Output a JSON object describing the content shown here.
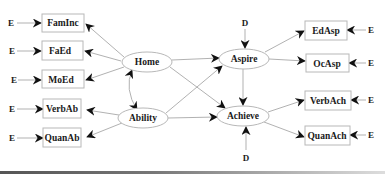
{
  "diagram": {
    "type": "structural-equation-model",
    "observed_exogenous": [
      {
        "id": "faminc",
        "label": "FamInc",
        "error": "E"
      },
      {
        "id": "faed",
        "label": "FaEd",
        "error": "E"
      },
      {
        "id": "moed",
        "label": "MoEd",
        "error": "E"
      },
      {
        "id": "verbab",
        "label": "VerbAb",
        "error": "E"
      },
      {
        "id": "quanab",
        "label": "QuanAb",
        "error": "E"
      }
    ],
    "latent_exogenous": [
      {
        "id": "home",
        "label": "Home"
      },
      {
        "id": "ability",
        "label": "Ability"
      }
    ],
    "latent_endogenous": [
      {
        "id": "aspire",
        "label": "Aspire",
        "disturbance": "D"
      },
      {
        "id": "achieve",
        "label": "Achieve",
        "disturbance": "D"
      }
    ],
    "observed_endogenous": [
      {
        "id": "edasp",
        "label": "EdAsp",
        "error": "E"
      },
      {
        "id": "ocasp",
        "label": "OcAsp",
        "error": "E"
      },
      {
        "id": "verbach",
        "label": "VerbAch",
        "error": "E"
      },
      {
        "id": "quanach",
        "label": "QuanAch",
        "error": "E"
      }
    ],
    "error_label": "E",
    "disturbance_label": "D",
    "edges": [
      {
        "from": "home",
        "to": "faminc"
      },
      {
        "from": "home",
        "to": "faed"
      },
      {
        "from": "home",
        "to": "moed"
      },
      {
        "from": "ability",
        "to": "verbab"
      },
      {
        "from": "ability",
        "to": "quanab"
      },
      {
        "from": "home",
        "to": "ability",
        "bidirectional": true
      },
      {
        "from": "home",
        "to": "aspire"
      },
      {
        "from": "home",
        "to": "achieve"
      },
      {
        "from": "ability",
        "to": "aspire"
      },
      {
        "from": "ability",
        "to": "achieve"
      },
      {
        "from": "aspire",
        "to": "achieve"
      },
      {
        "from": "aspire",
        "to": "edasp"
      },
      {
        "from": "aspire",
        "to": "ocasp"
      },
      {
        "from": "achieve",
        "to": "verbach"
      },
      {
        "from": "achieve",
        "to": "quanach"
      }
    ]
  }
}
